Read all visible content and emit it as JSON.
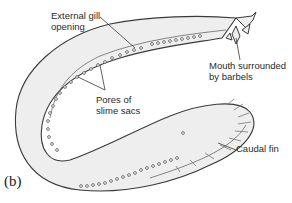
{
  "figure": {
    "panel_label": "(b)",
    "labels": {
      "gill_opening": "External gill\nopening",
      "mouth": "Mouth surrounded\nby barbels",
      "pores": "Pores of\nslime sacs",
      "caudal_fin": "Caudal fin"
    },
    "colors": {
      "body_fill": "#eeeeee",
      "outline": "#3a3a3a",
      "pore": "#555555",
      "leader": "#3a3a3a"
    }
  }
}
